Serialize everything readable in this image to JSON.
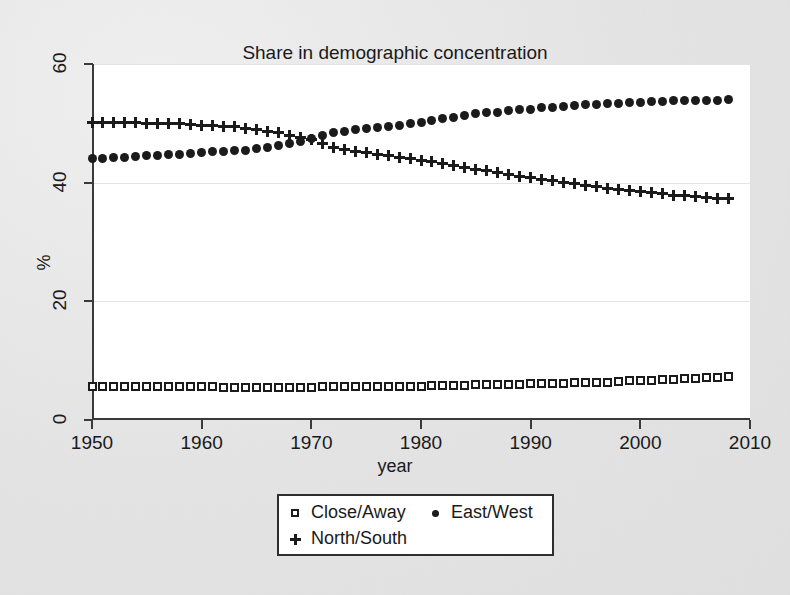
{
  "chart_data": {
    "type": "scatter",
    "title": "Share in demographic concentration",
    "xlabel": "year",
    "ylabel": "%",
    "xlim": [
      1950,
      2010
    ],
    "ylim": [
      0,
      60
    ],
    "xticks": [
      1950,
      1960,
      1970,
      1980,
      1990,
      2000,
      2010
    ],
    "yticks": [
      0,
      20,
      40,
      60
    ],
    "grid": true,
    "legend_position": "below-center",
    "x": [
      1950,
      1951,
      1952,
      1953,
      1954,
      1955,
      1956,
      1957,
      1958,
      1959,
      1960,
      1961,
      1962,
      1963,
      1964,
      1965,
      1966,
      1967,
      1968,
      1969,
      1970,
      1971,
      1972,
      1973,
      1974,
      1975,
      1976,
      1977,
      1978,
      1979,
      1980,
      1981,
      1982,
      1983,
      1984,
      1985,
      1986,
      1987,
      1988,
      1989,
      1990,
      1991,
      1992,
      1993,
      1994,
      1995,
      1996,
      1997,
      1998,
      1999,
      2000,
      2001,
      2002,
      2003,
      2004,
      2005,
      2006,
      2007,
      2008
    ],
    "series": [
      {
        "name": "Close/Away",
        "marker": "open-square",
        "color": "#1b1b1b",
        "values": [
          5.6,
          5.6,
          5.6,
          5.6,
          5.6,
          5.6,
          5.6,
          5.6,
          5.6,
          5.6,
          5.6,
          5.6,
          5.5,
          5.5,
          5.5,
          5.5,
          5.5,
          5.5,
          5.5,
          5.5,
          5.5,
          5.6,
          5.7,
          5.7,
          5.7,
          5.7,
          5.7,
          5.7,
          5.7,
          5.7,
          5.7,
          5.8,
          5.8,
          5.8,
          5.8,
          5.9,
          5.9,
          5.9,
          6.0,
          6.0,
          6.1,
          6.1,
          6.2,
          6.2,
          6.3,
          6.3,
          6.4,
          6.4,
          6.5,
          6.6,
          6.6,
          6.7,
          6.8,
          6.9,
          7.0,
          7.0,
          7.1,
          7.2,
          7.3
        ]
      },
      {
        "name": "East/West",
        "marker": "filled-circle",
        "color": "#1b1b1b",
        "values": [
          44.0,
          44.1,
          44.2,
          44.3,
          44.4,
          44.5,
          44.6,
          44.7,
          44.8,
          45.0,
          45.1,
          45.2,
          45.3,
          45.4,
          45.5,
          45.7,
          45.9,
          46.2,
          46.6,
          47.0,
          47.4,
          47.9,
          48.4,
          48.7,
          48.9,
          49.1,
          49.3,
          49.5,
          49.7,
          49.9,
          50.2,
          50.5,
          50.8,
          51.0,
          51.3,
          51.6,
          51.8,
          51.9,
          52.1,
          52.3,
          52.4,
          52.6,
          52.7,
          52.9,
          53.0,
          53.1,
          53.2,
          53.3,
          53.4,
          53.5,
          53.5,
          53.6,
          53.7,
          53.8,
          53.8,
          53.8,
          53.9,
          53.9,
          54.0
        ]
      },
      {
        "name": "North/South",
        "marker": "plus",
        "color": "#1b1b1b",
        "values": [
          50.2,
          50.2,
          50.2,
          50.1,
          50.1,
          50.0,
          50.0,
          49.9,
          49.9,
          49.8,
          49.7,
          49.6,
          49.5,
          49.4,
          49.2,
          49.0,
          48.7,
          48.4,
          48.0,
          47.6,
          47.2,
          46.6,
          46.0,
          45.6,
          45.3,
          45.1,
          44.8,
          44.6,
          44.3,
          44.1,
          43.8,
          43.5,
          43.2,
          42.9,
          42.6,
          42.3,
          42.0,
          41.7,
          41.4,
          41.1,
          40.9,
          40.6,
          40.3,
          40.1,
          39.8,
          39.6,
          39.3,
          39.1,
          38.9,
          38.7,
          38.5,
          38.3,
          38.1,
          37.9,
          37.8,
          37.6,
          37.5,
          37.4,
          37.3
        ]
      }
    ]
  },
  "legend": {
    "entries": [
      {
        "label": "Close/Away",
        "marker": "open-square"
      },
      {
        "label": "East/West",
        "marker": "filled-circle"
      },
      {
        "label": "North/South",
        "marker": "plus"
      }
    ]
  }
}
